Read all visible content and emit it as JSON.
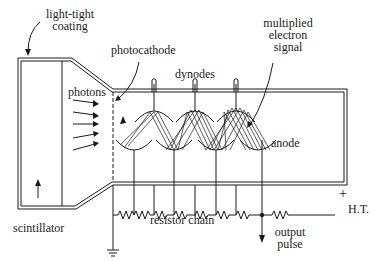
{
  "diagram": {
    "labels": {
      "light_tight_coating": [
        "light-tight",
        "coating"
      ],
      "photocathode": "photocathode",
      "photons": "photons",
      "dynodes": "dynodes",
      "multiplied_electron_signal": [
        "multiplied",
        "electron",
        "signal"
      ],
      "anode": "anode",
      "scintillator": "scintillator",
      "resistor_chain": "resistor chain",
      "ht": "H.T.",
      "ht_sign": "+",
      "output_pulse": [
        "output",
        "pulse"
      ]
    },
    "components": {
      "dynode_count": 7,
      "photon_arrows": 5
    },
    "colors": {
      "ink": "#1a1a1a",
      "background": "#ffffff"
    }
  }
}
